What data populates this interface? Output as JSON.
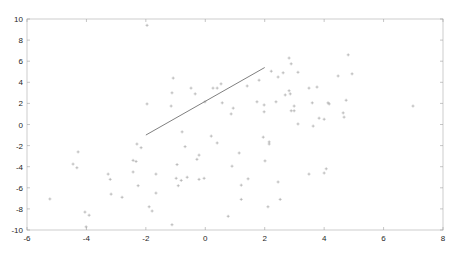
{
  "chart_data": {
    "type": "scatter",
    "title": "",
    "xlabel": "",
    "ylabel": "",
    "xlim": [
      -6,
      8
    ],
    "ylim": [
      -10,
      10
    ],
    "xticks": [
      -6,
      -4,
      -2,
      0,
      2,
      4,
      6,
      8
    ],
    "yticks": [
      -10,
      -8,
      -6,
      -4,
      -2,
      0,
      2,
      4,
      6,
      8,
      10
    ],
    "grid": false,
    "legend": null,
    "colors": {
      "axis": "#262626",
      "frame": "#c0c0c0",
      "points": "#a0a0a0",
      "line": "#808080"
    },
    "series": [
      {
        "name": "points",
        "type": "scatter",
        "marker": "+",
        "points": [
          [
            -5.23,
            -7.06
          ],
          [
            -4.28,
            -2.6
          ],
          [
            -4.45,
            -3.75
          ],
          [
            -4.32,
            -4.1
          ],
          [
            -4.05,
            -8.3
          ],
          [
            -3.91,
            -8.6
          ],
          [
            -4.01,
            -9.7
          ],
          [
            -3.27,
            -4.7
          ],
          [
            -3.2,
            -5.2
          ],
          [
            -3.17,
            -6.6
          ],
          [
            -2.8,
            -6.9
          ],
          [
            -2.43,
            -3.4
          ],
          [
            -2.33,
            -3.5
          ],
          [
            -2.43,
            -4.5
          ],
          [
            -2.3,
            -1.85
          ],
          [
            -2.16,
            -2.2
          ],
          [
            -2.26,
            -5.8
          ],
          [
            -1.66,
            -4.7
          ],
          [
            -1.66,
            -6.5
          ],
          [
            -1.89,
            -7.8
          ],
          [
            -1.79,
            -8.2
          ],
          [
            -0.78,
            -0.7
          ],
          [
            -0.68,
            -2.1
          ],
          [
            -0.95,
            -3.8
          ],
          [
            -0.98,
            -5.1
          ],
          [
            -0.81,
            -5.3
          ],
          [
            -0.91,
            -5.8
          ],
          [
            -0.61,
            -5.0
          ],
          [
            -0.28,
            -3.3
          ],
          [
            -0.21,
            -2.9
          ],
          [
            -0.21,
            -5.2
          ],
          [
            -0.04,
            -5.1
          ],
          [
            0.2,
            -1.1
          ],
          [
            0.4,
            -1.75
          ],
          [
            -1.12,
            -9.5
          ],
          [
            0.77,
            -8.7
          ],
          [
            -1.96,
            9.4
          ],
          [
            -1.08,
            4.4
          ],
          [
            -1.12,
            3.0
          ],
          [
            -1.96,
            1.95
          ],
          [
            -1.15,
            1.75
          ],
          [
            -0.48,
            3.45
          ],
          [
            -0.34,
            2.9
          ],
          [
            -0.01,
            2.15
          ],
          [
            0.26,
            3.45
          ],
          [
            0.4,
            3.45
          ],
          [
            0.53,
            3.85
          ],
          [
            0.57,
            2.05
          ],
          [
            0.94,
            1.55
          ],
          [
            0.87,
            1.0
          ],
          [
            1.41,
            3.65
          ],
          [
            1.74,
            2.15
          ],
          [
            1.81,
            4.2
          ],
          [
            1.98,
            1.85
          ],
          [
            1.98,
            1.2
          ],
          [
            2.22,
            5.05
          ],
          [
            2.45,
            4.5
          ],
          [
            2.62,
            4.9
          ],
          [
            2.38,
            2.15
          ],
          [
            2.69,
            2.8
          ],
          [
            2.82,
            6.3
          ],
          [
            2.89,
            5.75
          ],
          [
            2.82,
            3.2
          ],
          [
            2.86,
            2.9
          ],
          [
            2.99,
            1.75
          ],
          [
            2.89,
            1.3
          ],
          [
            2.99,
            1.3
          ],
          [
            3.12,
            4.95
          ],
          [
            3.12,
            0.05
          ],
          [
            3.49,
            3.45
          ],
          [
            3.6,
            2.05
          ],
          [
            3.63,
            -0.15
          ],
          [
            3.76,
            3.55
          ],
          [
            3.83,
            0.6
          ],
          [
            4.0,
            0.5
          ],
          [
            4.17,
            1.95
          ],
          [
            1.95,
            -1.2
          ],
          [
            2.15,
            -1.65
          ],
          [
            2.15,
            -1.85
          ],
          [
            1.14,
            -2.7
          ],
          [
            0.9,
            -3.95
          ],
          [
            2.01,
            -3.45
          ],
          [
            1.44,
            -5.15
          ],
          [
            1.21,
            -5.75
          ],
          [
            1.21,
            -7.1
          ],
          [
            2.45,
            -5.45
          ],
          [
            2.52,
            -7.1
          ],
          [
            2.11,
            -7.8
          ],
          [
            3.49,
            -4.7
          ],
          [
            4.0,
            -4.6
          ],
          [
            4.07,
            -4.2
          ],
          [
            4.81,
            6.6
          ],
          [
            4.94,
            4.8
          ],
          [
            4.47,
            4.6
          ],
          [
            4.13,
            2.05
          ],
          [
            4.74,
            2.3
          ],
          [
            4.64,
            1.1
          ],
          [
            4.67,
            0.7
          ],
          [
            6.99,
            1.75
          ]
        ]
      },
      {
        "name": "fit-segment",
        "type": "line",
        "points": [
          [
            -2.0,
            -1.0
          ],
          [
            2.0,
            5.4
          ]
        ]
      }
    ]
  }
}
